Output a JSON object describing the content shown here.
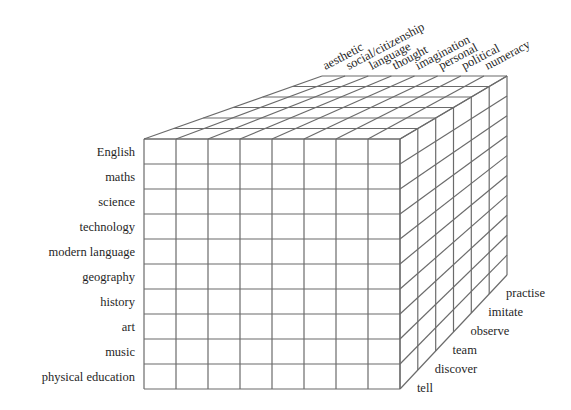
{
  "diagram": {
    "line_color": "#6b6b6b",
    "subjects": [
      "English",
      "maths",
      "science",
      "technology",
      "modern language",
      "geography",
      "history",
      "art",
      "music",
      "physical education"
    ],
    "forms_of_understanding": [
      "aesthetic",
      "social/citizenship",
      "language",
      "thought",
      "imagination",
      "personal",
      "political",
      "numeracy"
    ],
    "teaching_methods": [
      "tell",
      "discover",
      "team",
      "observe",
      "imitate",
      "practise"
    ],
    "geometry": {
      "front": {
        "x0": 144,
        "y0": 139,
        "x1": 400,
        "y1": 389
      },
      "back": {
        "x0": 322,
        "y0": 76,
        "x1": 507,
        "y1": 275
      },
      "columns": 8,
      "rows": 10,
      "depth": 6
    }
  }
}
